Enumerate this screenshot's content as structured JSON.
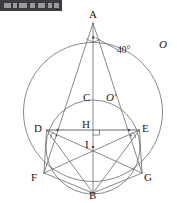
{
  "figure": {
    "title_visible": false,
    "background_color": "#ffffff",
    "stroke_color": "#6b6b6b",
    "label_color": "#1b1b1b",
    "canvas": {
      "width": 180,
      "height": 203
    }
  },
  "toolbar": {
    "present": true,
    "color": "#3b3b40",
    "marks": [
      {
        "left": 4,
        "width": 7
      },
      {
        "left": 13,
        "width": 4
      },
      {
        "left": 19,
        "width": 8
      },
      {
        "left": 30,
        "width": 5
      },
      {
        "left": 38,
        "width": 7
      },
      {
        "left": 48,
        "width": 4
      },
      {
        "left": 54,
        "width": 5
      }
    ]
  },
  "labels": {
    "vertex_a": "A",
    "vertex_b": "B",
    "vertex_c": "C",
    "vertex_d": "D",
    "vertex_e": "E",
    "vertex_f": "F",
    "vertex_g": "G",
    "point_h": "H",
    "point_i": "I",
    "circle_outer": "O",
    "circle_inner": "O'",
    "angle_at_a": "40°"
  },
  "geometry": {
    "circles": [
      {
        "name": "outer-circle-O",
        "cx": 93,
        "cy": 112,
        "r": 69.5
      },
      {
        "name": "inner-circle-O-prime",
        "cx": 93,
        "cy": 147,
        "r": 47
      }
    ],
    "points": {
      "A": {
        "x": 93,
        "y": 23
      },
      "B": {
        "x": 93,
        "y": 193
      },
      "C": {
        "x": 93,
        "y": 100
      },
      "D": {
        "x": 46.5,
        "y": 130
      },
      "E": {
        "x": 139.5,
        "y": 130
      },
      "F": {
        "x": 44,
        "y": 173
      },
      "G": {
        "x": 142,
        "y": 173
      },
      "H": {
        "x": 93,
        "y": 130
      },
      "I": {
        "x": 93,
        "y": 147
      }
    },
    "segments": [
      {
        "from": "A",
        "to": "F"
      },
      {
        "from": "A",
        "to": "G"
      },
      {
        "from": "A",
        "to": "B"
      },
      {
        "from": "D",
        "to": "E"
      },
      {
        "from": "D",
        "to": "F"
      },
      {
        "from": "E",
        "to": "G"
      },
      {
        "from": "D",
        "to": "B"
      },
      {
        "from": "E",
        "to": "B"
      },
      {
        "from": "F",
        "to": "B"
      },
      {
        "from": "G",
        "to": "B"
      },
      {
        "from": "D",
        "to": "G"
      },
      {
        "from": "E",
        "to": "F"
      }
    ],
    "marks": {
      "right_angle_at_H": true,
      "angle_arc_at_A": true,
      "angle_ticks_at_D": 2,
      "angle_ticks_at_E": 2,
      "tick_dot_on_DE_left": true,
      "tick_dot_on_DE_right": true,
      "center_dot_I": true,
      "center_dot_A_angle": true
    }
  }
}
